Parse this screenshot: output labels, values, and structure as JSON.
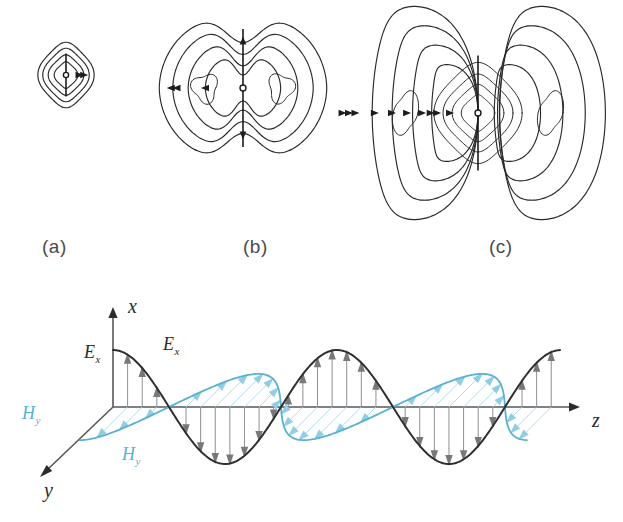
{
  "figure": {
    "background_color": "#ffffff",
    "accent_color": "#56b2d2",
    "line_color": "#2a2a2a",
    "arrow_gray": "#8d8f92"
  },
  "panels": [
    {
      "id": "a",
      "label": "(a)",
      "label_x": 42,
      "label_y": 236,
      "description": "near-field closed loops hugging the dipole",
      "center_x": 66,
      "center_y": 75,
      "scale": 0.52,
      "contour_count": 4,
      "arrow_direction": "right"
    },
    {
      "id": "b",
      "label": "(b)",
      "label_x": 243,
      "label_y": 236,
      "description": "expanded two-lobe field pattern with inner loops",
      "center_x": 243,
      "center_y": 88,
      "scale": 0.95,
      "contour_count": 4,
      "arrow_direction": "left"
    },
    {
      "id": "c",
      "label": "(c)",
      "label_x": 489,
      "label_y": 236,
      "description": "detached radiation lobes separating from the near field",
      "center_x": 478,
      "center_y": 113,
      "scale": 1.25,
      "contour_count": 4,
      "arrow_direction": "right"
    }
  ],
  "wave": {
    "axes": {
      "origin_x": 113,
      "origin_y": 407,
      "x_axis": {
        "label": "x",
        "label_x": 128,
        "label_y": 313,
        "tip_x": 113,
        "tip_y": 307
      },
      "y_axis": {
        "label": "y",
        "label_x": 44,
        "label_y": 497,
        "tip_x": 40,
        "tip_y": 477
      },
      "z_axis": {
        "label": "z",
        "label_x": 592,
        "label_y": 427,
        "tip_x": 580,
        "tip_y": 407
      }
    },
    "labels": [
      {
        "name": "E-axis-label",
        "text": "E",
        "sub": "x",
        "x": 84,
        "y": 358,
        "color": "#2b2b2b"
      },
      {
        "name": "E-curve-label",
        "text": "E",
        "sub": "x",
        "x": 163,
        "y": 350,
        "color": "#2b2b2b"
      },
      {
        "name": "H-axis-label",
        "text": "H",
        "sub": "y",
        "x": 22,
        "y": 419,
        "color": "#56b2d2"
      },
      {
        "name": "H-curve-label",
        "text": "H",
        "sub": "y",
        "x": 122,
        "y": 460,
        "color": "#56b2d2"
      }
    ],
    "e_field": {
      "name": "electric-field-wave",
      "color": "#2f2f2f",
      "amplitude": 57,
      "wavelength": 224,
      "cycles": 2,
      "phase": "cosine",
      "arrow_color": "#8d8f92",
      "arrow_count": 30
    },
    "h_field": {
      "name": "magnetic-field-wave",
      "color": "#56b2d2",
      "amplitude": 46,
      "wavelength": 224,
      "cycles": 2,
      "phase": "cosine",
      "skew_x": -0.72,
      "skew_y": 0.72,
      "arrow_color": "#8fcee4",
      "arrow_count": 30
    }
  },
  "caption_fragment": ""
}
